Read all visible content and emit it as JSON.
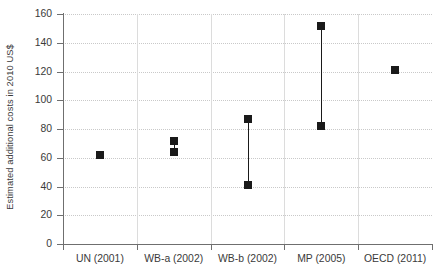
{
  "chart_data": {
    "type": "scatter",
    "title": "",
    "xlabel": "",
    "ylabel": "Estimated additional costs in 2010 US$",
    "ylim": [
      0,
      160
    ],
    "yticks": [
      0,
      20,
      40,
      60,
      80,
      100,
      120,
      140,
      160
    ],
    "grid": "horizontal-dotted",
    "legend": "none",
    "categories": [
      "UN (2001)",
      "WB-a (2002)",
      "WB-b (2002)",
      "MP (2005)",
      "OECD (2011)"
    ],
    "series": [
      {
        "name": "Estimated additional costs",
        "points": [
          {
            "category": "UN (2001)",
            "low": 62,
            "high": 62,
            "values": [
              62
            ]
          },
          {
            "category": "WB-a (2002)",
            "low": 64,
            "high": 72,
            "values": [
              64,
              72
            ]
          },
          {
            "category": "WB-b (2002)",
            "low": 41,
            "high": 87,
            "values": [
              41,
              87
            ]
          },
          {
            "category": "MP (2005)",
            "low": 82,
            "high": 152,
            "values": [
              82,
              152
            ]
          },
          {
            "category": "OECD (2011)",
            "low": 121,
            "high": 121,
            "values": [
              121
            ]
          }
        ]
      }
    ],
    "marker_color": "#1a1a1a",
    "gridline_color": "#c9c9c9",
    "axis_color": "#6f6f6f"
  },
  "axis": {
    "y_title": "Estimated additional costs in 2010 US$",
    "y_tick_labels": [
      "0",
      "20",
      "40",
      "60",
      "80",
      "100",
      "120",
      "140",
      "160"
    ],
    "x_tick_labels": [
      "UN (2001)",
      "WB-a (2002)",
      "WB-b (2002)",
      "MP (2005)",
      "OECD (2011)"
    ]
  }
}
